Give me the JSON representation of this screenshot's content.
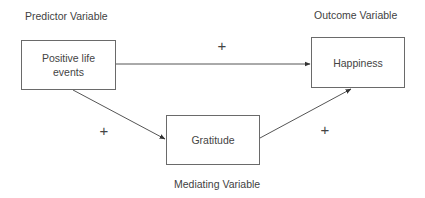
{
  "diagram": {
    "labels": {
      "predictor": "Predictor Variable",
      "outcome": "Outcome Variable",
      "mediator": "Mediating Variable"
    },
    "nodes": {
      "positive_life_events": {
        "line1": "Positive life",
        "line2": "events"
      },
      "happiness": "Happiness",
      "gratitude": "Gratitude"
    },
    "edges": [
      {
        "from": "Positive life events",
        "to": "Happiness",
        "sign": "+"
      },
      {
        "from": "Positive life events",
        "to": "Gratitude",
        "sign": "+"
      },
      {
        "from": "Gratitude",
        "to": "Happiness",
        "sign": "+"
      }
    ],
    "signs": {
      "direct": "+",
      "a_path": "+",
      "b_path": "+"
    }
  }
}
